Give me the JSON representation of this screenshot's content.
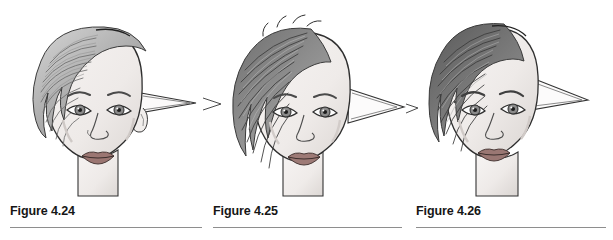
{
  "page": {
    "type": "textbook-figure-plate",
    "background_color": "#ffffff",
    "width": 613,
    "height": 240
  },
  "figures": [
    {
      "id": "figure-4-24",
      "caption": "Figure 4.24",
      "hair_style": "long wavy swept-back light gray hair",
      "hair_tone": "#b9b9b9",
      "ear_style": "long narrow pointed elf ear angled upward to the right",
      "head_tilt": "three-quarter view facing viewer",
      "features": [
        "eyes",
        "eyebrows",
        "nose",
        "lips",
        "neck",
        "ear-lobe-detail"
      ]
    },
    {
      "id": "figure-4-25",
      "caption": "Figure 4.25",
      "hair_style": "spiky short feathered dark gray hair swept forward",
      "hair_tone": "#7d7d7d",
      "ear_style": "broad triangular pointed elf ear extending right",
      "head_tilt": "three-quarter view facing viewer",
      "features": [
        "eyes",
        "eyebrows",
        "nose",
        "lips",
        "neck"
      ]
    },
    {
      "id": "figure-4-26",
      "caption": "Figure 4.26",
      "hair_style": "short dark brushed-back hair with visible strand texture",
      "hair_tone": "#6a6a6a",
      "ear_style": "narrow triangular pointed elf ear extending right",
      "head_tilt": "three-quarter view turned slightly left",
      "features": [
        "eyes",
        "eyebrows",
        "nose",
        "lips",
        "neck",
        "beauty-mark"
      ]
    }
  ],
  "caption_style": {
    "weight": "bold",
    "color": "#161616",
    "rule_color": "#8e8e8e"
  },
  "colors": {
    "ink": "#2b2b2b",
    "skin": "#f2efee",
    "skin_shadow": "#dedad8",
    "hair_light": "#c3c3c3",
    "hair_mid": "#9a9a9a",
    "hair_dark": "#5f5f5f",
    "lips": "#8d6a66",
    "background": "#ffffff"
  }
}
